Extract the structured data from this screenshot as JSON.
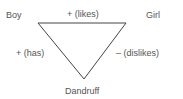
{
  "diagram": {
    "nodes": {
      "top_left": "Boy",
      "top_right": "Girl",
      "bottom": "Dandruff"
    },
    "edges": {
      "top": "+ (likes)",
      "left": "+ (has)",
      "right": "– (dislikes)"
    },
    "line_color": "#444444"
  }
}
